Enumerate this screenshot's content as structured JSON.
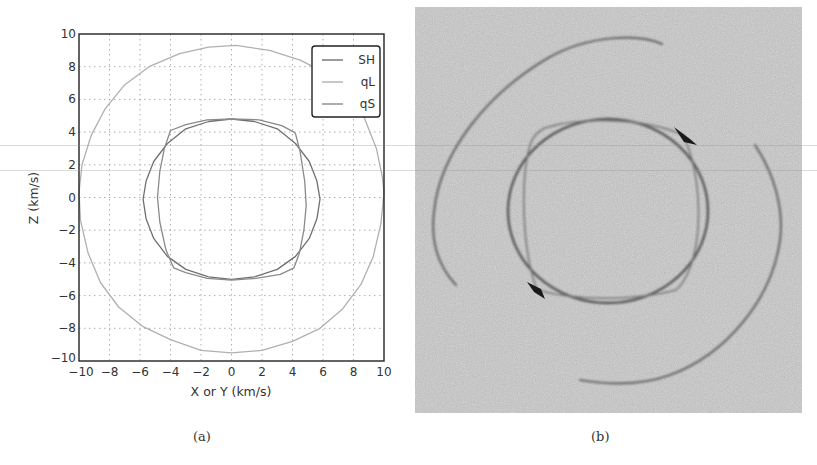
{
  "figure": {
    "panel_a": {
      "caption": "(a)"
    },
    "panel_b": {
      "caption": "(b)",
      "description": "Simulated wavefront image (grayscale noise) showing outer qL arcs, inner SH ellipse and qS cusp features",
      "background_color": "#b9b9b9"
    }
  },
  "chart_data": {
    "type": "line",
    "title": "",
    "xlabel": "X or Y (km/s)",
    "ylabel": "Z (km/s)",
    "xlim": [
      -10,
      10
    ],
    "ylim": [
      -10,
      10
    ],
    "xticks": [
      -10,
      -8,
      -6,
      -4,
      -2,
      0,
      2,
      4,
      6,
      8,
      10
    ],
    "yticks": [
      -10,
      -8,
      -6,
      -4,
      -2,
      0,
      2,
      4,
      6,
      8,
      10
    ],
    "xtick_labels": [
      "−10",
      "−8",
      "−6",
      "−4",
      "−2",
      "0",
      "2",
      "4",
      "6",
      "8",
      "10"
    ],
    "ytick_labels": [
      "−10",
      "−8",
      "−6",
      "−4",
      "−2",
      "0",
      "2",
      "4",
      "6",
      "8",
      "10"
    ],
    "grid": true,
    "grid_style": "dotted",
    "legend_position": "upper right",
    "aspect": "equal",
    "series": [
      {
        "name": "SH",
        "color": "#707070",
        "points": [
          [
            0.0,
            4.8
          ],
          [
            1.5,
            4.65
          ],
          [
            3.0,
            4.2
          ],
          [
            4.2,
            3.3
          ],
          [
            5.1,
            2.2
          ],
          [
            5.6,
            1.0
          ],
          [
            5.8,
            -0.1
          ],
          [
            5.6,
            -1.3
          ],
          [
            5.1,
            -2.5
          ],
          [
            4.2,
            -3.6
          ],
          [
            3.0,
            -4.4
          ],
          [
            1.5,
            -4.85
          ],
          [
            0.0,
            -5.0
          ],
          [
            -1.5,
            -4.85
          ],
          [
            -3.0,
            -4.4
          ],
          [
            -4.2,
            -3.6
          ],
          [
            -5.1,
            -2.5
          ],
          [
            -5.6,
            -1.3
          ],
          [
            -5.8,
            -0.1
          ],
          [
            -5.6,
            1.0
          ],
          [
            -5.1,
            2.2
          ],
          [
            -4.2,
            3.3
          ],
          [
            -3.0,
            4.2
          ],
          [
            -1.5,
            4.65
          ],
          [
            0.0,
            4.8
          ]
        ]
      },
      {
        "name": "qL",
        "color": "#b0b0b0",
        "points": [
          [
            0.3,
            9.3
          ],
          [
            2.5,
            9.0
          ],
          [
            4.5,
            8.4
          ],
          [
            6.2,
            7.6
          ],
          [
            7.6,
            6.4
          ],
          [
            8.7,
            4.9
          ],
          [
            9.5,
            3.0
          ],
          [
            9.9,
            1.2
          ],
          [
            10.0,
            0.3
          ],
          [
            9.8,
            -1.6
          ],
          [
            9.3,
            -3.6
          ],
          [
            8.5,
            -5.3
          ],
          [
            7.3,
            -6.8
          ],
          [
            5.8,
            -8.0
          ],
          [
            4.0,
            -8.8
          ],
          [
            2.0,
            -9.35
          ],
          [
            0.0,
            -9.5
          ],
          [
            -2.0,
            -9.35
          ],
          [
            -4.0,
            -8.7
          ],
          [
            -5.8,
            -7.9
          ],
          [
            -7.4,
            -6.7
          ],
          [
            -8.6,
            -5.2
          ],
          [
            -9.4,
            -3.4
          ],
          [
            -9.9,
            -1.4
          ],
          [
            -10.0,
            0.3
          ],
          [
            -9.8,
            2.0
          ],
          [
            -9.2,
            3.8
          ],
          [
            -8.3,
            5.4
          ],
          [
            -7.0,
            6.9
          ],
          [
            -5.4,
            8.0
          ],
          [
            -3.4,
            8.8
          ],
          [
            -1.5,
            9.2
          ],
          [
            0.3,
            9.3
          ]
        ]
      },
      {
        "name": "qS",
        "color": "#8a8a8a",
        "points": [
          [
            0.0,
            4.8
          ],
          [
            1.8,
            4.75
          ],
          [
            3.3,
            4.4
          ],
          [
            4.1,
            4.0
          ],
          [
            4.2,
            3.9
          ],
          [
            4.5,
            2.8
          ],
          [
            4.8,
            1.0
          ],
          [
            4.9,
            -0.5
          ],
          [
            4.75,
            -2.0
          ],
          [
            4.45,
            -3.4
          ],
          [
            4.1,
            -4.3
          ],
          [
            3.2,
            -4.7
          ],
          [
            1.6,
            -4.95
          ],
          [
            0.0,
            -5.05
          ],
          [
            -1.6,
            -4.95
          ],
          [
            -3.0,
            -4.6
          ],
          [
            -3.8,
            -4.3
          ],
          [
            -4.3,
            -3.2
          ],
          [
            -4.7,
            -1.5
          ],
          [
            -4.85,
            0.0
          ],
          [
            -4.7,
            1.6
          ],
          [
            -4.4,
            3.0
          ],
          [
            -4.0,
            4.1
          ],
          [
            -3.0,
            4.45
          ],
          [
            -1.6,
            4.75
          ],
          [
            0.0,
            4.8
          ]
        ]
      }
    ]
  }
}
